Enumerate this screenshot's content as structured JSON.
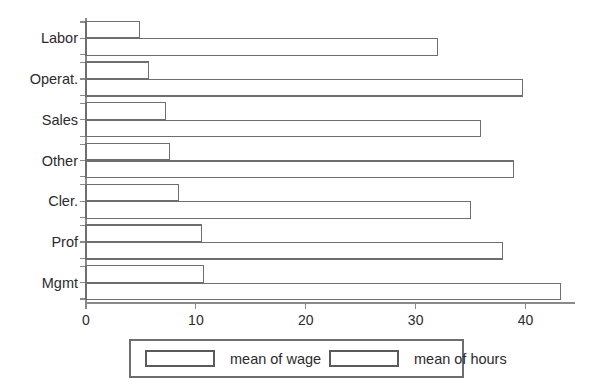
{
  "chart_data": {
    "type": "bar",
    "orientation": "horizontal",
    "title": "",
    "subtitle": "",
    "xlabel": "",
    "ylabel": "",
    "xlim": [
      0,
      44.5
    ],
    "xticks": [
      0,
      10,
      20,
      30,
      40
    ],
    "xticklabels": [
      "0",
      "10",
      "20",
      "30",
      "40"
    ],
    "grid": false,
    "legend_position": "bottom",
    "categories": [
      "Labor",
      "Operat.",
      "Sales",
      "Other",
      "Cler.",
      "Prof",
      "Mgmt"
    ],
    "series": [
      {
        "name": "mean of wage",
        "values": [
          4.9,
          5.7,
          7.2,
          7.6,
          8.4,
          10.5,
          10.7
        ]
      },
      {
        "name": "mean of hours",
        "values": [
          32.0,
          39.7,
          35.9,
          38.9,
          35.0,
          37.9,
          43.2
        ]
      }
    ],
    "colors": {
      "bar_fill": "#ffffff",
      "bar_stroke": "#6e6e6e",
      "axis": "#8a8a8a",
      "text": "#2b2b2b",
      "background": "#ffffff"
    }
  },
  "legend": {
    "entries": [
      {
        "label": "mean of wage"
      },
      {
        "label": "mean of hours"
      }
    ]
  }
}
